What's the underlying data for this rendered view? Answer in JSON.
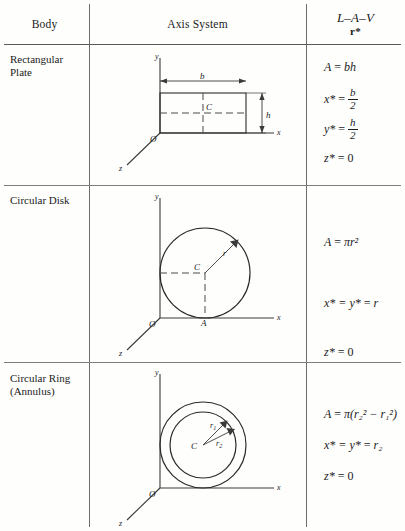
{
  "table": {
    "headers": {
      "body": "Body",
      "axis_system": "Axis System",
      "lav": "L–A–V",
      "lav_sub": "r*"
    },
    "rows": [
      {
        "body_label": "Rectangular Plate",
        "body_line1": "Rectangular",
        "body_line2": "Plate",
        "diagram": {
          "name": "rectangular-plate",
          "axis_labels": {
            "x": "x",
            "y": "y",
            "z": "z",
            "origin": "O"
          },
          "point_labels": {
            "centroid": "C"
          },
          "dimension_labels": {
            "width": "b",
            "height": "h"
          }
        },
        "formulas": [
          {
            "lhs": "A",
            "rhs": "bh"
          },
          {
            "lhs": "x*",
            "rhs_num": "b",
            "rhs_den": "2"
          },
          {
            "lhs": "y*",
            "rhs_num": "h",
            "rhs_den": "2"
          },
          {
            "lhs": "z*",
            "rhs": "0"
          }
        ]
      },
      {
        "body_label": "Circular Disk",
        "body_line1": "Circular Disk",
        "body_line2": "",
        "diagram": {
          "name": "circular-disk",
          "axis_labels": {
            "x": "x",
            "y": "y",
            "z": "z",
            "origin": "O"
          },
          "point_labels": {
            "centroid": "C",
            "tangent": "A"
          },
          "dimension_labels": {
            "radius": "r"
          }
        },
        "formulas": [
          {
            "lhs": "A",
            "rhs": "πr²"
          },
          {
            "lhs": "x* = y*",
            "rhs": "r"
          },
          {
            "lhs": "z*",
            "rhs": "0"
          }
        ]
      },
      {
        "body_label": "Circular Ring (Annulus)",
        "body_line1": "Circular Ring",
        "body_line2": "(Annulus)",
        "diagram": {
          "name": "circular-ring-annulus",
          "axis_labels": {
            "x": "x",
            "y": "y",
            "z": "z",
            "origin": "O"
          },
          "point_labels": {
            "centroid": "C"
          },
          "dimension_labels": {
            "inner_radius": "r₁",
            "outer_radius": "r₂"
          }
        },
        "formulas": [
          {
            "lhs": "A",
            "rhs": "π(r₂² − r₁²)"
          },
          {
            "lhs": "x* = y*",
            "rhs": "r₂"
          },
          {
            "lhs": "z*",
            "rhs": "0"
          }
        ]
      }
    ]
  },
  "colors": {
    "ink": "#1b1b1b",
    "rule": "#5a5a5a",
    "page": "#fefefd"
  }
}
